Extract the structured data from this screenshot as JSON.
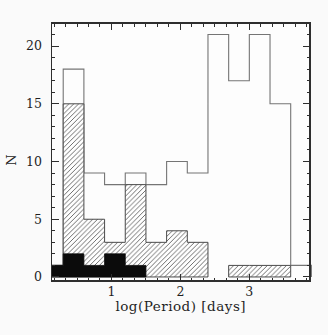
{
  "chart_data": {
    "type": "bar",
    "subtype": "overlaid-step-histograms",
    "title": "",
    "xlabel": "log(Period) [days]",
    "ylabel": "N",
    "xlim": [
      0.13,
      3.88
    ],
    "ylim": [
      -0.35,
      22
    ],
    "grid": false,
    "legend": null,
    "x_major_ticks": [
      1,
      2,
      3
    ],
    "x_tick_labels": [
      "1",
      "2",
      "3"
    ],
    "x_minor_per_unit": 6,
    "y_major_ticks": [
      0,
      5,
      10,
      15,
      20
    ],
    "y_tick_labels": [
      "0",
      "5",
      "10",
      "15",
      "20"
    ],
    "y_minor_step": 1,
    "bin_edges": [
      0.0,
      0.3,
      0.6,
      0.9,
      1.2,
      1.5,
      1.8,
      2.1,
      2.4,
      2.7,
      3.0,
      3.3,
      3.6,
      3.9
    ],
    "series": [
      {
        "name": "open",
        "style": "open-outline",
        "values": [
          1,
          18,
          9,
          8,
          9,
          8,
          10,
          9,
          21,
          17,
          21,
          15,
          1
        ]
      },
      {
        "name": "hatched",
        "style": "diagonal-hatch",
        "values": [
          1,
          15,
          5,
          3,
          8,
          3,
          4,
          3,
          0,
          1,
          1,
          1,
          0
        ]
      },
      {
        "name": "filled",
        "style": "solid-fill",
        "values": [
          1,
          2,
          1,
          2,
          1,
          0,
          0,
          0,
          0,
          0,
          0,
          0,
          0
        ]
      }
    ],
    "colors": {
      "frame": "#2e2e2e",
      "open_line": "#757575",
      "hatch_line": "#555555",
      "hatch_outline": "#4a4a4a",
      "solid_fill": "#0b0b0b",
      "plot_background": "#fdfdfd",
      "text": "#1f1f1f"
    }
  }
}
